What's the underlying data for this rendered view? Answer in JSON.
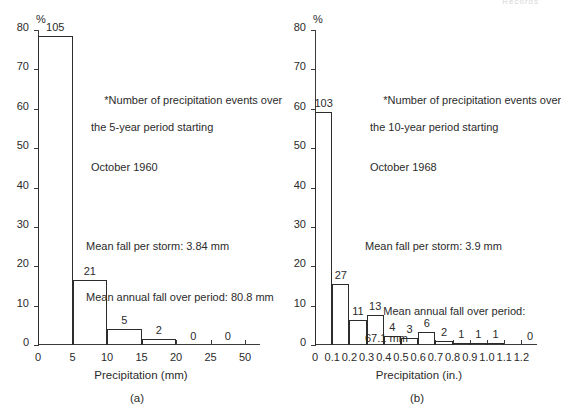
{
  "page": {
    "header_stub": "Records"
  },
  "chart_data": [
    {
      "type": "bar",
      "panel": "(a)",
      "title": "",
      "xlabel": "Precipitation (mm)",
      "ylabel": "%",
      "ylim": [
        0,
        80
      ],
      "yticks": [
        0,
        10,
        20,
        30,
        40,
        50,
        60,
        70,
        80
      ],
      "xlim": [
        0,
        30
      ],
      "xticks": [
        0,
        5,
        10,
        15,
        20,
        25,
        50
      ],
      "xtick_labels": [
        "0",
        "5",
        "10",
        "15",
        "20",
        "25",
        "50"
      ],
      "grid": false,
      "legend": "none",
      "bin_edges": [
        0,
        5,
        10,
        15,
        20,
        25,
        30
      ],
      "categories": [
        "0-5",
        "5-10",
        "10-15",
        "15-20",
        "20-25",
        "25-30"
      ],
      "values": [
        78.4,
        16.4,
        4.0,
        1.6,
        0.0,
        0.0
      ],
      "counts": [
        105,
        21,
        5,
        2,
        0,
        0
      ],
      "count_labels": [
        "105",
        "21",
        "5",
        "2",
        "0",
        "0"
      ],
      "annotation": {
        "line1": "*Number of precipitation events over",
        "line2": "the 5-year period starting",
        "line3": "October 1960",
        "line4": "Mean fall per storm: 3.84 mm",
        "line5": "Mean annual fall over period: 80.8 mm"
      }
    },
    {
      "type": "bar",
      "panel": "(b)",
      "title": "",
      "xlabel": "Precipitation (in.)",
      "ylabel": "%",
      "ylim": [
        0,
        80
      ],
      "yticks": [
        0,
        10,
        20,
        30,
        40,
        50,
        60,
        70,
        80
      ],
      "xlim": [
        0,
        1.2
      ],
      "xticks": [
        0,
        0.1,
        0.2,
        0.3,
        0.4,
        0.5,
        0.6,
        0.7,
        0.8,
        0.9,
        1.0,
        1.1,
        1.2
      ],
      "xtick_labels": [
        "0",
        "0.1",
        "0.2",
        "0.3",
        "0.4",
        "0.5",
        "0.6",
        "0.7",
        "0.8",
        "0.9",
        "1.0",
        "1.1",
        "1.2"
      ],
      "grid": false,
      "legend": "none",
      "bin_edges": [
        0.1,
        0.2,
        0.3,
        0.4,
        0.5,
        0.6,
        0.7,
        0.8,
        0.9,
        1.0,
        1.1,
        1.2
      ],
      "categories": [
        "0.1-0.2",
        "0.2-0.3",
        "0.3-0.4",
        "0.4-0.5",
        "0.5-0.6",
        "0.6-0.7",
        "0.7-0.8",
        "0.8-0.9",
        "0.9-1.0",
        "1.0-1.1",
        "1.1-1.2"
      ],
      "values": [
        59.2,
        15.5,
        6.3,
        7.5,
        2.3,
        1.7,
        3.4,
        1.1,
        0.6,
        0.6,
        0.6
      ],
      "counts": [
        103,
        27,
        11,
        13,
        4,
        3,
        6,
        2,
        1,
        1,
        1
      ],
      "count_labels": [
        "103",
        "27",
        "11",
        "13",
        "4",
        "3",
        "6",
        "2",
        "1",
        "1",
        "1"
      ],
      "zero_label": "0",
      "annotation": {
        "line1": "*Number of precipitation events over",
        "line2": "the 10-year period starting",
        "line3": "October 1968",
        "line4": "Mean fall per storm: 3.9 mm",
        "line5": "Mean annual fall over period:",
        "line6": "67.1 mm"
      }
    }
  ]
}
